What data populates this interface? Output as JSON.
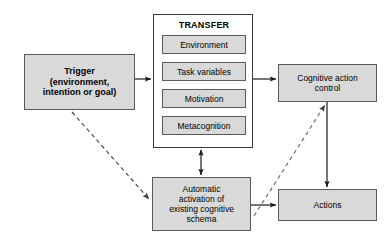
{
  "diagram": {
    "background_color": "#ffffff",
    "node_fill": "#d9d9d9",
    "node_stroke": "#5a5a5a",
    "arrow_color": "#1a1a1a",
    "dashed_arrow_color": "#6e6e6e"
  },
  "nodes": {
    "trigger": {
      "label": "Trigger\n(environment,\nintention or goal)",
      "bold": true
    },
    "transfer": {
      "title": "TRANSFER",
      "items": [
        {
          "label": "Environment"
        },
        {
          "label": "Task variables"
        },
        {
          "label": "Motivation"
        },
        {
          "label": "Metacognition"
        }
      ]
    },
    "cognitive_action_control": {
      "label": "Cognitive action\ncontrol"
    },
    "automatic_activation": {
      "label": "Automatic\nactivation of\nexisting cognitive\nschema"
    },
    "actions": {
      "label": "Actions"
    }
  },
  "edges": [
    {
      "name": "trigger-to-transfer",
      "from": "trigger",
      "to": "transfer",
      "style": "solid",
      "heads": "single"
    },
    {
      "name": "transfer-to-cognitive",
      "from": "transfer",
      "to": "cognitive_action_control",
      "style": "solid",
      "heads": "single"
    },
    {
      "name": "transfer-to-schema",
      "from": "transfer",
      "to": "automatic_activation",
      "style": "solid",
      "heads": "double"
    },
    {
      "name": "trigger-to-schema",
      "from": "trigger",
      "to": "automatic_activation",
      "style": "dashed",
      "heads": "single"
    },
    {
      "name": "schema-to-cognitive",
      "from": "automatic_activation",
      "to": "cognitive_action_control",
      "style": "dashed",
      "heads": "single"
    },
    {
      "name": "schema-to-actions",
      "from": "automatic_activation",
      "to": "actions",
      "style": "solid",
      "heads": "single"
    },
    {
      "name": "cognitive-to-actions",
      "from": "cognitive_action_control",
      "to": "actions",
      "style": "solid",
      "heads": "single"
    }
  ]
}
